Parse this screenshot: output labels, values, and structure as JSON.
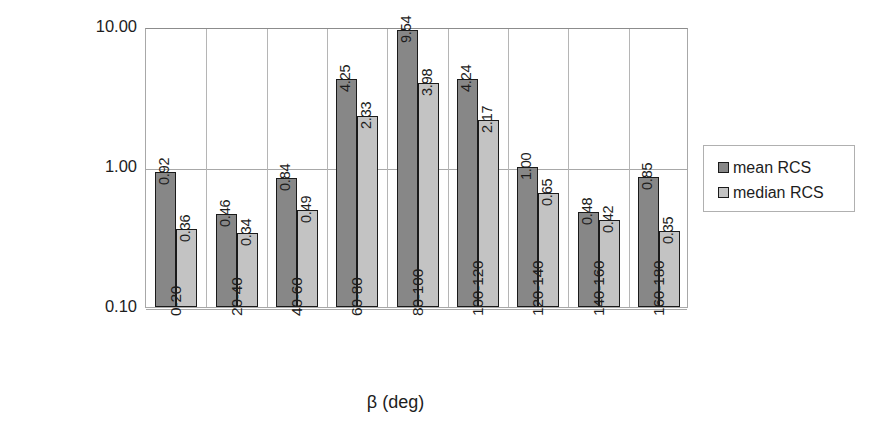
{
  "chart_data": {
    "type": "bar",
    "title": "",
    "xlabel": "β (deg)",
    "ylabel": "RCS (m²)",
    "ylabel_base": "RCS (m",
    "ylabel_sup": "2",
    "ylabel_tail": ")",
    "yscale": "log",
    "ylim": [
      0.1,
      10.0
    ],
    "ytick_labels": [
      "10.00",
      "1.00",
      "0.10"
    ],
    "ytick_values": [
      10.0,
      1.0,
      0.1
    ],
    "grid": true,
    "legend_position": "right",
    "categories": [
      "0-20",
      "20-40",
      "40-60",
      "60-80",
      "80-100",
      "100-120",
      "120-140",
      "140-160",
      "160-180"
    ],
    "series": [
      {
        "name": "mean RCS",
        "color": "#878787",
        "values": [
          0.92,
          0.46,
          0.84,
          4.25,
          9.54,
          4.24,
          1.0,
          0.48,
          0.85
        ],
        "labels": [
          "0.92",
          "0.46",
          "0.84",
          "4.25",
          "9.54",
          "4.24",
          "1.00",
          "0.48",
          "0.85"
        ]
      },
      {
        "name": "median RCS",
        "color": "#c3c3c3",
        "values": [
          0.36,
          0.34,
          0.49,
          2.33,
          3.98,
          2.17,
          0.65,
          0.42,
          0.35
        ],
        "labels": [
          "0.36",
          "0.34",
          "0.49",
          "2.33",
          "3.98",
          "2.17",
          "0.65",
          "0.42",
          "0.35"
        ]
      }
    ]
  },
  "legend": {
    "entries": [
      {
        "label": "mean RCS",
        "swatch": "mean"
      },
      {
        "label": "median RCS",
        "swatch": "median"
      }
    ]
  }
}
